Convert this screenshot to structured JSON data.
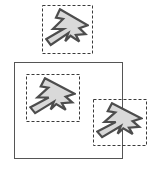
{
  "diagram": {
    "canvas": {
      "width": 160,
      "height": 169,
      "background": "#ffffff"
    },
    "colors": {
      "shape_fill": "#d9d9d9",
      "shape_stroke": "#4d4d4d",
      "dashed_box_stroke": "#3a3a3a",
      "container_stroke": "#555555",
      "background": "#ffffff"
    },
    "container_rect": {
      "label": "container-rectangle",
      "x": 14,
      "y": 62,
      "width": 108,
      "height": 96,
      "stroke": "#555555",
      "stroke_width": 1,
      "fill": "none",
      "style": "solid"
    },
    "shapes": [
      {
        "id": "shape-top",
        "label": "arrow-shape-top",
        "bbox": {
          "x": 42,
          "y": 5,
          "width": 50,
          "height": 48
        },
        "bbox_style": "dashed",
        "inside_container": false,
        "scale": 1.0,
        "rotation_deg": 0
      },
      {
        "id": "shape-inner-left",
        "label": "arrow-shape-inner-left",
        "bbox": {
          "x": 26,
          "y": 74,
          "width": 53,
          "height": 47
        },
        "bbox_style": "dashed",
        "inside_container": true,
        "scale": 1.0,
        "rotation_deg": 0
      },
      {
        "id": "shape-inner-right",
        "label": "arrow-shape-inner-right",
        "bbox": {
          "x": 93,
          "y": 99,
          "width": 53,
          "height": 46
        },
        "bbox_style": "dashed",
        "inside_container": true,
        "scale": 1.0,
        "rotation_deg": 0
      }
    ],
    "arrow_polygon": {
      "description": "zigzag arrow polygon pointing up-right with notched tail",
      "viewbox": {
        "width": 100,
        "height": 100
      },
      "points": "34,3 97,41 78,48 92,62 70,64 78,80 58,66 46,79 53,60 13,88 3,74 42,50 18,50 41,26 25,23"
    }
  }
}
